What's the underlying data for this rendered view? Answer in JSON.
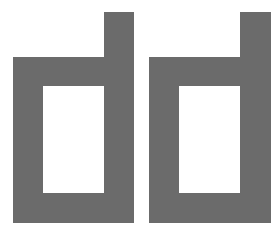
{
  "logo": {
    "text": "dd",
    "color": "#6b6b6b",
    "background": "#ffffff",
    "glyphs": [
      {
        "char": "d",
        "outer_left": 13,
        "bowl_top": 57,
        "stem_left": 104,
        "stem_right": 134,
        "stem_top": 12,
        "bottom": 223,
        "hole": {
          "left": 43,
          "top": 86,
          "right": 104,
          "bottom": 193
        }
      },
      {
        "char": "d",
        "outer_left": 149,
        "bowl_top": 57,
        "stem_left": 240,
        "stem_right": 271,
        "stem_top": 12,
        "bottom": 223,
        "hole": {
          "left": 179,
          "top": 86,
          "right": 240,
          "bottom": 193
        }
      }
    ]
  }
}
